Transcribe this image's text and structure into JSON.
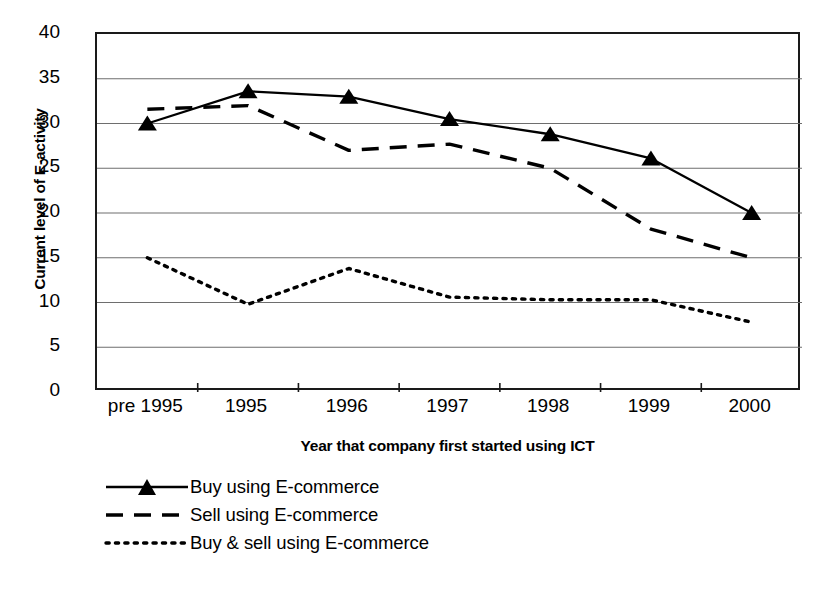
{
  "chart_data": {
    "type": "line",
    "title": "",
    "xlabel": "Year that company first started using ICT",
    "ylabel": "Current level of E-activity",
    "categories": [
      "pre 1995",
      "1995",
      "1996",
      "1997",
      "1998",
      "1999",
      "2000"
    ],
    "ylim": [
      0,
      40
    ],
    "yticks": [
      0,
      5,
      10,
      15,
      20,
      25,
      30,
      35,
      40
    ],
    "ytick_labels": [
      "0",
      "5",
      "10",
      "15",
      "20",
      "25",
      "30",
      "35",
      "40"
    ],
    "grid": "horizontal",
    "legend_position": "below-left",
    "series": [
      {
        "name": "Buy using E-commerce",
        "style": "solid",
        "marker": "triangle",
        "color": "#000000",
        "values": [
          30.0,
          33.6,
          33.0,
          30.5,
          28.8,
          26.1,
          20.0
        ]
      },
      {
        "name": "Sell using E-commerce",
        "style": "dashed",
        "marker": "none",
        "color": "#000000",
        "values": [
          31.6,
          32.0,
          27.0,
          27.7,
          25.0,
          18.2,
          15.0
        ]
      },
      {
        "name": "Buy & sell using E-commerce",
        "style": "dotted",
        "marker": "none",
        "color": "#000000",
        "values": [
          15.0,
          9.8,
          13.8,
          10.6,
          10.3,
          10.3,
          7.8
        ]
      }
    ]
  },
  "legend": {
    "items": [
      {
        "label": "Buy using E-commerce"
      },
      {
        "label": "Sell using E-commerce"
      },
      {
        "label": "Buy & sell using E-commerce"
      }
    ]
  },
  "colors": {
    "ink": "#000000",
    "frame": "#1a1a1a",
    "gridline": "#6e6e6e",
    "background": "#ffffff"
  }
}
